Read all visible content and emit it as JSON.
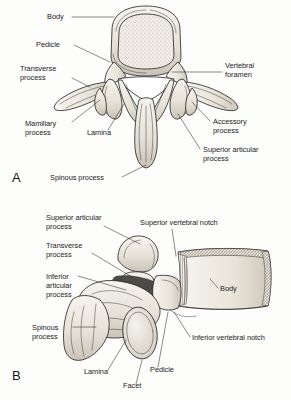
{
  "figure": {
    "background_color": "#fdfdfc",
    "ink_color": "#1c1c1c",
    "bone_fill": "#eeeae2",
    "bone_shadow": "#c8c2b6",
    "width": 291,
    "height": 400
  },
  "panels": [
    {
      "letter": "A",
      "view": "superior-view",
      "labels": [
        {
          "id": "body",
          "lines": [
            "Body"
          ],
          "x": 47,
          "y": 19,
          "align": "start"
        },
        {
          "id": "pedicle",
          "lines": [
            "Pedicle"
          ],
          "x": 36,
          "y": 47,
          "align": "start"
        },
        {
          "id": "transverse-process",
          "lines": [
            "Transverse",
            "process"
          ],
          "x": 20,
          "y": 71,
          "align": "start"
        },
        {
          "id": "mamillary-process",
          "lines": [
            "Mamillary",
            "process"
          ],
          "x": 25,
          "y": 126,
          "align": "start"
        },
        {
          "id": "lamina",
          "lines": [
            "Lamina"
          ],
          "x": 87,
          "y": 135,
          "align": "start"
        },
        {
          "id": "spinous-process",
          "lines": [
            "Spinous process"
          ],
          "x": 50,
          "y": 180,
          "align": "start"
        },
        {
          "id": "vertebral-foramen",
          "lines": [
            "Vertebral",
            "foramen"
          ],
          "x": 225,
          "y": 68,
          "align": "start"
        },
        {
          "id": "accessory-process",
          "lines": [
            "Accessory",
            "process"
          ],
          "x": 213,
          "y": 124,
          "align": "start"
        },
        {
          "id": "superior-articular-process",
          "lines": [
            "Superior articular",
            "process"
          ],
          "x": 203,
          "y": 152,
          "align": "start"
        }
      ]
    },
    {
      "letter": "B",
      "view": "lateral-view",
      "labels": [
        {
          "id": "superior-articular-process",
          "lines": [
            "Superior articular",
            "process"
          ],
          "x": 46,
          "y": 220,
          "align": "start"
        },
        {
          "id": "transverse-process",
          "lines": [
            "Transverse",
            "process"
          ],
          "x": 46,
          "y": 248,
          "align": "start"
        },
        {
          "id": "inferior-articular-process",
          "lines": [
            "Inferior",
            "articular",
            "process"
          ],
          "x": 46,
          "y": 279,
          "align": "start"
        },
        {
          "id": "spinous-process",
          "lines": [
            "Spinous",
            "process"
          ],
          "x": 32,
          "y": 330,
          "align": "start"
        },
        {
          "id": "superior-vertebral-notch",
          "lines": [
            "Superior vertebral notch"
          ],
          "x": 140,
          "y": 225,
          "align": "start"
        },
        {
          "id": "body",
          "lines": [
            "Body"
          ],
          "x": 220,
          "y": 291,
          "align": "start"
        },
        {
          "id": "inferior-vertebral-notch",
          "lines": [
            "Inferior vertebral notch"
          ],
          "x": 192,
          "y": 340,
          "align": "start"
        },
        {
          "id": "lamina",
          "lines": [
            "Lamina"
          ],
          "x": 84,
          "y": 374,
          "align": "start"
        },
        {
          "id": "facet",
          "lines": [
            "Facet"
          ],
          "x": 123,
          "y": 388,
          "align": "start"
        },
        {
          "id": "pedicle",
          "lines": [
            "Pedicle"
          ],
          "x": 150,
          "y": 372,
          "align": "start"
        }
      ]
    }
  ]
}
